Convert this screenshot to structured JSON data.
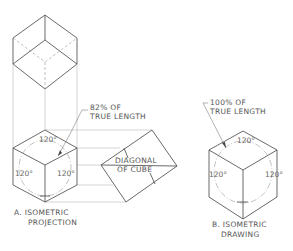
{
  "figure": {
    "part_a": {
      "caption_line1": "A. ISOMETRIC",
      "caption_line2": "PROJECTION",
      "callout_line1": "82% OF",
      "callout_line2": "TRUE LENGTH",
      "diagonal_line1": "DIAGONAL",
      "diagonal_line2": "OF CUBE",
      "angles": [
        "120°",
        "120°",
        "120°"
      ]
    },
    "part_b": {
      "caption_line1": "B. ISOMETRIC",
      "caption_line2": "DRAWING",
      "callout_line1": "100% OF",
      "callout_line2": "TRUE LENGTH",
      "angles": [
        "120°",
        "120°",
        "120°"
      ]
    }
  }
}
